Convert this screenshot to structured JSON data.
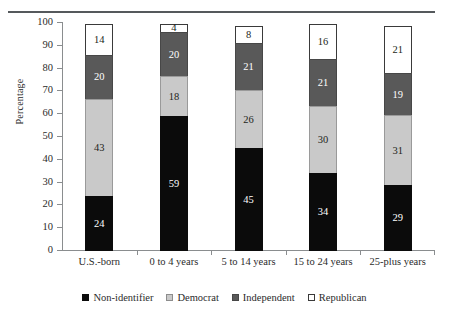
{
  "chart_data": {
    "type": "bar",
    "stacked": true,
    "title": "",
    "xlabel": "",
    "ylabel": "Percentage",
    "ylim": [
      0,
      100
    ],
    "yticks": [
      0,
      10,
      20,
      30,
      40,
      50,
      60,
      70,
      80,
      90,
      100
    ],
    "ytick_labels": [
      "0",
      "10",
      "20",
      "30",
      "40",
      "50",
      "60",
      "70",
      "80",
      "90",
      "100"
    ],
    "grid": false,
    "legend_position": "bottom",
    "categories": [
      "U.S.-born",
      "0 to 4 years",
      "5 to 14 years",
      "15 to 24 years",
      "25-plus years"
    ],
    "series": [
      {
        "name": "Non-identifier",
        "color": "#0b0b0b",
        "values": [
          24,
          59,
          45,
          34,
          29
        ],
        "labels": [
          "24",
          "59",
          "45",
          "34",
          "29"
        ]
      },
      {
        "name": "Democrat",
        "color": "#c9c9c9",
        "values": [
          43,
          18,
          26,
          30,
          31
        ],
        "labels": [
          "43",
          "18",
          "26",
          "30",
          "31"
        ]
      },
      {
        "name": "Independent",
        "color": "#595959",
        "values": [
          20,
          20,
          21,
          21,
          19
        ],
        "labels": [
          "20",
          "20",
          "21",
          "21",
          "19"
        ]
      },
      {
        "name": "Republican",
        "color": "#ffffff",
        "values": [
          14,
          4,
          8,
          16,
          21
        ],
        "labels": [
          "14",
          "4",
          "8",
          "16",
          "21"
        ]
      }
    ]
  },
  "axis": {
    "y_title": "Percentage",
    "y_ticks": [
      "100",
      "90",
      "80",
      "70",
      "60",
      "50",
      "40",
      "30",
      "20",
      "10",
      "0"
    ],
    "x_categories": [
      "U.S.-born",
      "0 to 4 years",
      "5 to 14 years",
      "15 to 24 years",
      "25-plus years"
    ]
  },
  "legend": {
    "items": [
      {
        "label": "Non-identifier",
        "color": "#0b0b0b"
      },
      {
        "label": "Democrat",
        "color": "#c9c9c9"
      },
      {
        "label": "Independent",
        "color": "#595959"
      },
      {
        "label": "Republican",
        "color": "#ffffff"
      }
    ]
  },
  "bars": [
    {
      "category": "U.S.-born",
      "segments": [
        {
          "series": "Republican",
          "value": "14"
        },
        {
          "series": "Independent",
          "value": "20"
        },
        {
          "series": "Democrat",
          "value": "43"
        },
        {
          "series": "Non-identifier",
          "value": "24"
        }
      ]
    },
    {
      "category": "0 to 4 years",
      "segments": [
        {
          "series": "Republican",
          "value": "4"
        },
        {
          "series": "Independent",
          "value": "20"
        },
        {
          "series": "Democrat",
          "value": "18"
        },
        {
          "series": "Non-identifier",
          "value": "59"
        }
      ]
    },
    {
      "category": "5 to 14 years",
      "segments": [
        {
          "series": "Republican",
          "value": "8"
        },
        {
          "series": "Independent",
          "value": "21"
        },
        {
          "series": "Democrat",
          "value": "26"
        },
        {
          "series": "Non-identifier",
          "value": "45"
        }
      ]
    },
    {
      "category": "15 to 24 years",
      "segments": [
        {
          "series": "Republican",
          "value": "16"
        },
        {
          "series": "Independent",
          "value": "21"
        },
        {
          "series": "Democrat",
          "value": "30"
        },
        {
          "series": "Non-identifier",
          "value": "34"
        }
      ]
    },
    {
      "category": "25-plus years",
      "segments": [
        {
          "series": "Republican",
          "value": "21"
        },
        {
          "series": "Independent",
          "value": "19"
        },
        {
          "series": "Democrat",
          "value": "31"
        },
        {
          "series": "Non-identifier",
          "value": "29"
        }
      ]
    }
  ]
}
